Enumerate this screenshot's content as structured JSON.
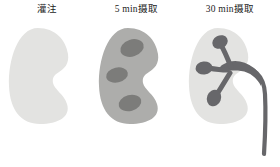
{
  "figure": {
    "title": "",
    "background_color": "#ffffff",
    "panel_count": 3
  },
  "palette": {
    "kidney_pale": "#e3e3e1",
    "kidney_mid": "#adadab",
    "lesion_dark": "#7c7c7a",
    "collecting_system_dark": "#67676a",
    "label_text": "#1c1c1c"
  },
  "panels": [
    {
      "id": "perfusion",
      "label": "灌注",
      "kidney_fill": "#e3e3e1",
      "features": [],
      "has_collecting_system": false,
      "has_ureter": false
    },
    {
      "id": "uptake-5min",
      "label": "5 min摄取",
      "kidney_fill": "#adadab",
      "features": [
        {
          "name": "upper-lesion",
          "fill": "#7c7c7a"
        },
        {
          "name": "middle-lesion",
          "fill": "#7c7c7a"
        },
        {
          "name": "lower-lesion",
          "fill": "#7c7c7a"
        }
      ],
      "has_collecting_system": false,
      "has_ureter": false
    },
    {
      "id": "uptake-30min",
      "label": "30 min摄取",
      "kidney_fill": "#e3e3e1",
      "features": [
        {
          "name": "upper-calyx",
          "fill": "#67676a"
        },
        {
          "name": "middle-calyx",
          "fill": "#67676a"
        },
        {
          "name": "lower-calyx",
          "fill": "#67676a"
        },
        {
          "name": "renal-pelvis",
          "fill": "#67676a"
        }
      ],
      "has_collecting_system": true,
      "has_ureter": true
    }
  ]
}
